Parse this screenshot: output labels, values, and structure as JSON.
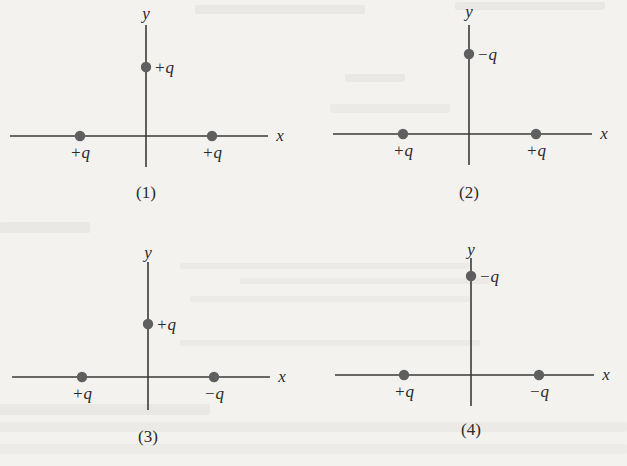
{
  "figure": {
    "colors": {
      "background": "#f3f2ef",
      "axis": "#3a3a3a",
      "charge": "#5f5f5f",
      "text": "#2b2b2b"
    },
    "axis_labels": {
      "x": "x",
      "y": "y"
    },
    "panels": [
      {
        "id": 1,
        "caption": "(1)",
        "origin": [
          146,
          136
        ],
        "x_axis": [
          10,
          268
        ],
        "y_axis": [
          25,
          167
        ],
        "x_label_pos": [
          280,
          141
        ],
        "y_label_pos": [
          146,
          19
        ],
        "caption_pos": [
          146,
          198
        ],
        "charges": [
          {
            "label": "+q",
            "sign": "+",
            "position": "on y-axis",
            "cx": 146,
            "cy": 67,
            "lx": 154,
            "ly": 73,
            "anchor": "start"
          },
          {
            "label": "+q",
            "sign": "+",
            "position": "left on x-axis",
            "cx": 80,
            "cy": 136,
            "lx": 80,
            "ly": 158,
            "anchor": "middle"
          },
          {
            "label": "+q",
            "sign": "+",
            "position": "right on x-axis",
            "cx": 212,
            "cy": 136,
            "lx": 212,
            "ly": 158,
            "anchor": "middle"
          }
        ]
      },
      {
        "id": 2,
        "caption": "(2)",
        "origin": [
          469,
          134
        ],
        "x_axis": [
          333,
          592
        ],
        "y_axis": [
          25,
          165
        ],
        "x_label_pos": [
          604,
          139
        ],
        "y_label_pos": [
          469,
          17
        ],
        "caption_pos": [
          469,
          198
        ],
        "charges": [
          {
            "label": "−q",
            "sign": "-",
            "position": "on y-axis",
            "cx": 469,
            "cy": 54,
            "lx": 477,
            "ly": 60,
            "anchor": "start"
          },
          {
            "label": "+q",
            "sign": "+",
            "position": "left on x-axis",
            "cx": 403,
            "cy": 134,
            "lx": 403,
            "ly": 156,
            "anchor": "middle"
          },
          {
            "label": "+q",
            "sign": "+",
            "position": "right on x-axis",
            "cx": 536,
            "cy": 134,
            "lx": 536,
            "ly": 156,
            "anchor": "middle"
          }
        ]
      },
      {
        "id": 3,
        "caption": "(3)",
        "origin": [
          148,
          377
        ],
        "x_axis": [
          12,
          270
        ],
        "y_axis": [
          262,
          410
        ],
        "x_label_pos": [
          282,
          382
        ],
        "y_label_pos": [
          148,
          258
        ],
        "caption_pos": [
          148,
          442
        ],
        "charges": [
          {
            "label": "+q",
            "sign": "+",
            "position": "on y-axis",
            "cx": 148,
            "cy": 324,
            "lx": 156,
            "ly": 330,
            "anchor": "start"
          },
          {
            "label": "+q",
            "sign": "+",
            "position": "left on x-axis",
            "cx": 82,
            "cy": 377,
            "lx": 82,
            "ly": 399,
            "anchor": "middle"
          },
          {
            "label": "−q",
            "sign": "-",
            "position": "right on x-axis",
            "cx": 214,
            "cy": 377,
            "lx": 214,
            "ly": 399,
            "anchor": "middle"
          }
        ]
      },
      {
        "id": 4,
        "caption": "(4)",
        "origin": [
          471,
          375
        ],
        "x_axis": [
          335,
          594
        ],
        "y_axis": [
          258,
          406
        ],
        "x_label_pos": [
          606,
          380
        ],
        "y_label_pos": [
          471,
          255
        ],
        "caption_pos": [
          471,
          435
        ],
        "charges": [
          {
            "label": "−q",
            "sign": "-",
            "position": "on y-axis",
            "cx": 471,
            "cy": 276,
            "lx": 479,
            "ly": 282,
            "anchor": "start"
          },
          {
            "label": "+q",
            "sign": "+",
            "position": "left on x-axis",
            "cx": 404,
            "cy": 375,
            "lx": 404,
            "ly": 397,
            "anchor": "middle"
          },
          {
            "label": "−q",
            "sign": "-",
            "position": "right on x-axis",
            "cx": 539,
            "cy": 375,
            "lx": 539,
            "ly": 397,
            "anchor": "middle"
          }
        ]
      }
    ]
  }
}
